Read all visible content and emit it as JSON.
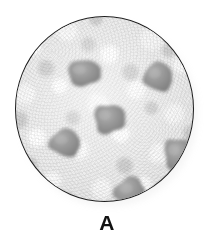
{
  "figure": {
    "label": "A",
    "caption_label": "A",
    "background_color": "#ffffff"
  },
  "dish": {
    "name": "circular specimen field",
    "outline_color": "#1d1d1d",
    "medium_color": "#ebebeb",
    "texture_description": "mottled granular gray-white",
    "center_x": 104,
    "center_y": 109,
    "diameter": 179
  },
  "chart_data": {
    "type": "scatter",
    "title": "A",
    "xlabel": "",
    "ylabel": "",
    "xlim": [
      0,
      179
    ],
    "ylim": [
      0,
      186
    ],
    "grid": false,
    "legend": null,
    "annotations": [
      "A"
    ],
    "series": [
      {
        "name": "colonies",
        "color": "#8a8a8a",
        "count": 6,
        "points": [
          {
            "id": 1,
            "label": "top-left colony",
            "x": 68,
            "y": 56,
            "rx": 16,
            "ry": 13
          },
          {
            "id": 2,
            "label": "top-right colony",
            "x": 143,
            "y": 60,
            "rx": 15,
            "ry": 14
          },
          {
            "id": 3,
            "label": "center colony",
            "x": 93,
            "y": 102,
            "rx": 15,
            "ry": 15
          },
          {
            "id": 4,
            "label": "mid-left colony",
            "x": 50,
            "y": 126,
            "rx": 16,
            "ry": 13
          },
          {
            "id": 5,
            "label": "mid-right colony",
            "x": 162,
            "y": 137,
            "rx": 14,
            "ry": 16
          },
          {
            "id": 6,
            "label": "bottom-center colony",
            "x": 115,
            "y": 175,
            "rx": 16,
            "ry": 14
          }
        ]
      }
    ]
  },
  "colors": {
    "spot_fill_dark": "#7e7e7e",
    "spot_fill_mid": "#9a9a9a",
    "spot_fill_light": "#b4b4b4",
    "spot_edge": "#6e6e6e",
    "outline": "#1d1d1d",
    "label_text": "#121212",
    "page_background": "#ffffff"
  }
}
